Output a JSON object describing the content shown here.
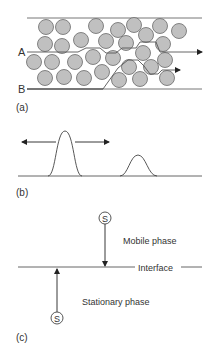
{
  "panel_a": {
    "label": "(a)",
    "path_a_label": "A",
    "path_b_label": "B",
    "particle_fill": "#c0c0c0",
    "particle_stroke": "#6a6a6a",
    "particles": [
      [
        46,
        27
      ],
      [
        63,
        27
      ],
      [
        96,
        26
      ],
      [
        118,
        30
      ],
      [
        134,
        25
      ],
      [
        160,
        26
      ],
      [
        179,
        31
      ],
      [
        45,
        44
      ],
      [
        62,
        46
      ],
      [
        81,
        40
      ],
      [
        106,
        41
      ],
      [
        126,
        43
      ],
      [
        146,
        35
      ],
      [
        163,
        44
      ],
      [
        34,
        62
      ],
      [
        52,
        62
      ],
      [
        75,
        62
      ],
      [
        93,
        57
      ],
      [
        113,
        58
      ],
      [
        143,
        53
      ],
      [
        165,
        60
      ],
      [
        45,
        78
      ],
      [
        64,
        77
      ],
      [
        84,
        78
      ],
      [
        102,
        72
      ],
      [
        119,
        80
      ],
      [
        140,
        79
      ],
      [
        167,
        78
      ],
      [
        129,
        67
      ],
      [
        151,
        67
      ]
    ]
  },
  "panel_b": {
    "label": "(b)"
  },
  "panel_c": {
    "label": "(c)",
    "solute_symbol": "S",
    "mobile_phase": "Mobile phase",
    "interface": "Interface",
    "stationary_phase": "Stationary phase"
  }
}
